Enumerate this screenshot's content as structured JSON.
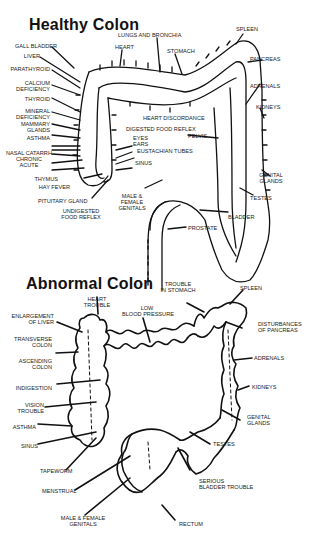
{
  "healthy": {
    "title": "Healthy Colon",
    "labels": {
      "gall_bladder": "GALL BLADDER",
      "liver": "LIVER",
      "parathyroid": "PARATHYROID",
      "calcium_deficiency": "CALCIUM\nDEFICIENCY",
      "thyroid": "THYROID",
      "mineral_deficiency": "MINERAL\nDEFICIENCY",
      "mammary_glands": "MAMMARY\nGLANDS",
      "asthma": "ASTHMA",
      "nasal_catarrh": "NASAL CATARRH\nCHRONIC\nACUTE",
      "thymus": "THYMUS",
      "hay_fever": "HAY FEVER",
      "pituitary_gland": "PITUITARY GLAND",
      "undigested_food_reflex": "UNDIGESTED\nFOOD REFLEX",
      "heart": "HEART",
      "lungs_and_bronchia": "LUNGS AND BRONCHIA",
      "stomach": "STOMACH",
      "spleen": "SPLEEN",
      "pancreas": "PANCREAS",
      "adrenals": "ADRENALS",
      "kidneys": "KIDNEYS",
      "heart_discordance": "HEART DISCORDANCE",
      "digested_food_reflex": "DIGESTED FOOD REFLEX",
      "eyes_ears": "EYES\nEARS",
      "eustachian_tubes": "EUSTACHIAN TUBES",
      "sinus": "SINUS",
      "pelvis": "PELVIS",
      "male_female_genitals": "MALE &\nFEMALE\nGENITALS",
      "genital_glands": "GENITAL\nGLANDS",
      "testes": "TESTES",
      "bladder": "BLADDER",
      "prostate": "PROSTATE"
    }
  },
  "abnormal": {
    "title": "Abnormal Colon",
    "labels": {
      "heart_trouble": "HEART\nTROUBLE",
      "enlargement_of_liver": "ENLARGEMENT\nOF LIVER",
      "transverse_colon": "TRANSVERSE\nCOLON",
      "ascending_colon": "ASCENDING\nCOLON",
      "indigestion": "INDIGESTION",
      "vision_trouble": "VISION\nTROUBLE",
      "asthma": "ASTHMA",
      "sinus": "SINUS",
      "tapeworm": "TAPEWORM",
      "menstrual": "MENSTRUAL",
      "male_female_genitals": "MALE & FEMALE\nGENITALS",
      "low_blood_pressure": "LOW\nBLOOD PRESSURE",
      "trouble_in_stomach": "TROUBLE\nIN STOMACH",
      "spleen": "SPLEEN",
      "disturbances_of_pancreas": "DISTURBANCES\nOF PANCREAS",
      "adrenals": "ADRENALS",
      "kidneys": "KIDNEYS",
      "genital_glands": "GENITAL\nGLANDS",
      "testes": "TESTES",
      "serious_bladder_trouble": "SERIOUS\nBLADDER TROUBLE",
      "rectum": "RECTUM"
    }
  },
  "colors": {
    "ink": "#111111",
    "background": "#ffffff"
  }
}
